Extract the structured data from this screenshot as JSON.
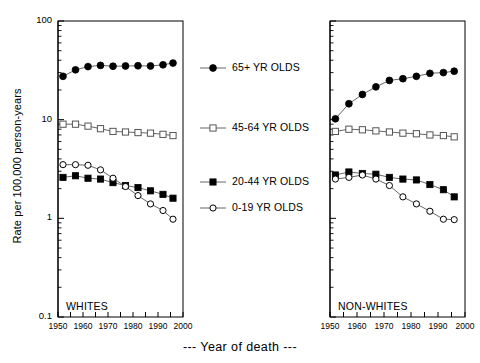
{
  "figure": {
    "caption": "---  Year of death  ---",
    "ylabel": "Rate per 100,000 person-years"
  },
  "legend": {
    "entries": [
      {
        "label": "65+ YR OLDS",
        "marker": "filled-circle"
      },
      {
        "label": "45-64 YR OLDS",
        "marker": "open-square"
      },
      {
        "label": "20-44 YR OLDS",
        "marker": "filled-square"
      },
      {
        "label": "0-19 YR OLDS",
        "marker": "open-circle"
      }
    ]
  },
  "chart_data": [
    {
      "type": "line",
      "title": "WHITES",
      "panel": "left",
      "xlabel": "Year of death",
      "ylabel": "Rate per 100,000 person-years",
      "xlim": [
        1950,
        2000
      ],
      "ylim": [
        0.1,
        100
      ],
      "yscale": "log",
      "xticks": [
        1950,
        1955,
        1960,
        1965,
        1970,
        1975,
        1980,
        1985,
        1990,
        1995,
        2000
      ],
      "xticklabels": [
        "1950",
        "",
        "1960",
        "",
        "1970",
        "",
        "1980",
        "",
        "1990",
        "",
        "2000"
      ],
      "yticks": [
        0.1,
        1,
        10,
        100
      ],
      "yticklabels": [
        "0.1",
        "1",
        "10",
        "100"
      ],
      "grid": false,
      "series": [
        {
          "name": "65+ YR OLDS",
          "marker": "filled-circle",
          "x": [
            1952,
            1957,
            1962,
            1967,
            1972,
            1977,
            1982,
            1987,
            1992,
            1996
          ],
          "values": [
            27.5,
            32.0,
            34.5,
            35.5,
            34.8,
            35.0,
            35.2,
            35.0,
            36.0,
            37.5
          ]
        },
        {
          "name": "45-64 YR OLDS",
          "marker": "open-square",
          "x": [
            1952,
            1957,
            1962,
            1967,
            1972,
            1977,
            1982,
            1987,
            1992,
            1996
          ],
          "values": [
            9.0,
            9.0,
            8.6,
            8.1,
            7.6,
            7.5,
            7.4,
            7.3,
            7.1,
            6.9
          ]
        },
        {
          "name": "20-44 YR OLDS",
          "marker": "filled-square",
          "x": [
            1952,
            1957,
            1962,
            1967,
            1972,
            1977,
            1982,
            1987,
            1992,
            1996
          ],
          "values": [
            2.6,
            2.7,
            2.55,
            2.5,
            2.3,
            2.15,
            2.05,
            1.9,
            1.75,
            1.6
          ]
        },
        {
          "name": "0-19 YR OLDS",
          "marker": "open-circle",
          "x": [
            1952,
            1957,
            1962,
            1967,
            1972,
            1977,
            1982,
            1987,
            1992,
            1996
          ],
          "values": [
            3.5,
            3.5,
            3.45,
            3.1,
            2.55,
            2.1,
            1.7,
            1.4,
            1.2,
            0.98
          ]
        }
      ]
    },
    {
      "type": "line",
      "title": "NON-WHITES",
      "panel": "right",
      "xlabel": "Year of death",
      "ylabel": "Rate per 100,000 person-years",
      "xlim": [
        1950,
        2000
      ],
      "ylim": [
        0.1,
        100
      ],
      "yscale": "log",
      "xticks": [
        1950,
        1955,
        1960,
        1965,
        1970,
        1975,
        1980,
        1985,
        1990,
        1995,
        2000
      ],
      "xticklabels": [
        "1950",
        "",
        "1960",
        "",
        "1970",
        "",
        "1980",
        "",
        "1990",
        "",
        "2000"
      ],
      "yticks": [
        0.1,
        1,
        10,
        100
      ],
      "yticklabels": [
        "",
        "",
        "",
        ""
      ],
      "grid": false,
      "series": [
        {
          "name": "65+ YR OLDS",
          "marker": "filled-circle",
          "x": [
            1952,
            1957,
            1962,
            1967,
            1972,
            1977,
            1982,
            1987,
            1992,
            1996
          ],
          "values": [
            10.2,
            14.5,
            18.0,
            21.5,
            25.0,
            26.0,
            27.5,
            29.5,
            30.0,
            31.0
          ]
        },
        {
          "name": "45-64 YR OLDS",
          "marker": "open-square",
          "x": [
            1952,
            1957,
            1962,
            1967,
            1972,
            1977,
            1982,
            1987,
            1992,
            1996
          ],
          "values": [
            7.6,
            8.0,
            7.9,
            7.7,
            7.5,
            7.3,
            7.2,
            7.0,
            6.9,
            6.7
          ]
        },
        {
          "name": "20-44 YR OLDS",
          "marker": "filled-square",
          "x": [
            1952,
            1957,
            1962,
            1967,
            1972,
            1977,
            1982,
            1987,
            1992,
            1996
          ],
          "values": [
            2.75,
            2.95,
            2.85,
            2.8,
            2.6,
            2.5,
            2.45,
            2.2,
            1.95,
            1.65
          ]
        },
        {
          "name": "0-19 YR OLDS",
          "marker": "open-circle",
          "x": [
            1952,
            1957,
            1962,
            1967,
            1972,
            1977,
            1982,
            1987,
            1992,
            1996
          ],
          "values": [
            2.5,
            2.6,
            2.75,
            2.5,
            2.15,
            1.65,
            1.4,
            1.18,
            0.98,
            0.97
          ]
        }
      ]
    }
  ]
}
